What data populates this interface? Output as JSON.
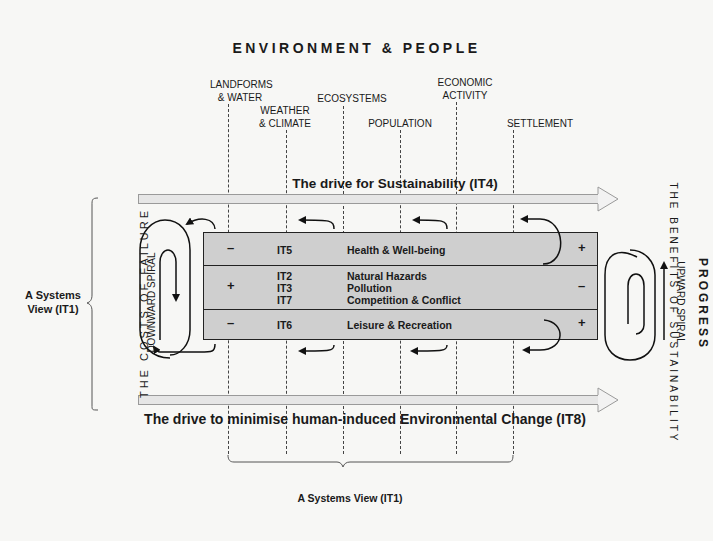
{
  "title": "ENVIRONMENT & PEOPLE",
  "categories": [
    {
      "label": "LANDFORMS\n& WATER"
    },
    {
      "label": "WEATHER\n& CLIMATE"
    },
    {
      "label": "ECOSYSTEMS"
    },
    {
      "label": "POPULATION"
    },
    {
      "label": "ECONOMIC\nACTIVITY"
    },
    {
      "label": "SETTLEMENT"
    }
  ],
  "top_drive": "The drive for Sustainability (IT4)",
  "bottom_drive": "The drive to minimise human-induced Environmental Change (IT8)",
  "box_rows": [
    {
      "left_sign": "–",
      "codes": "IT5",
      "themes": "Health & Well-being",
      "right_sign": "+"
    },
    {
      "left_sign": "+",
      "codes": "IT2\nIT3\nIT7",
      "themes": "Natural Hazards\nPollution\nCompetition & Conflict",
      "right_sign": "–"
    },
    {
      "left_sign": "–",
      "codes": "IT6",
      "themes": "Leisure & Recreation",
      "right_sign": "+"
    }
  ],
  "left": {
    "systems_view": "A Systems\nView (IT1)",
    "costs_label": "THE COSTS OF FAILURE",
    "spiral_label": "DOWNWARD SPIRAL"
  },
  "right": {
    "progress_label": "PROGRESS",
    "benefits_label": "THE BENEFITS OF SUSTAINABILITY",
    "spiral_label": "UPWARD SPIRAL"
  },
  "bottom_systems_view": "A Systems View (IT1)",
  "colors": {
    "background": "#f7f7f5",
    "box_fill": "#cfcfcf",
    "arrow_fill": "#e6e6e6",
    "line": "#222222"
  }
}
